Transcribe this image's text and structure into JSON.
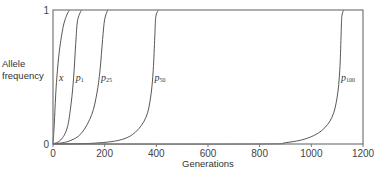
{
  "chart_data": {
    "type": "line",
    "title": "",
    "xlabel": "Generations",
    "ylabel": "Allele frequency",
    "xlim": [
      0,
      1200
    ],
    "ylim": [
      0,
      1
    ],
    "x_ticks": [
      0,
      200,
      400,
      600,
      800,
      1000,
      1200
    ],
    "y_ticks": [
      0,
      1
    ],
    "grid": false,
    "legend": "inline curve labels",
    "series": [
      {
        "name": "x",
        "label_main": "x",
        "label_sub": "",
        "points": [
          [
            0,
            0
          ],
          [
            5,
            0.15
          ],
          [
            10,
            0.35
          ],
          [
            15,
            0.5
          ],
          [
            25,
            0.7
          ],
          [
            40,
            0.88
          ],
          [
            55,
            0.97
          ],
          [
            65,
            1
          ]
        ]
      },
      {
        "name": "p1",
        "label_main": "p",
        "label_sub": "1",
        "points": [
          [
            0,
            0
          ],
          [
            30,
            0.03
          ],
          [
            55,
            0.12
          ],
          [
            70,
            0.3
          ],
          [
            80,
            0.5
          ],
          [
            88,
            0.75
          ],
          [
            95,
            0.92
          ],
          [
            110,
            1
          ]
        ]
      },
      {
        "name": "p25",
        "label_main": "p",
        "label_sub": "25",
        "points": [
          [
            0,
            0
          ],
          [
            60,
            0.02
          ],
          [
            110,
            0.08
          ],
          [
            150,
            0.22
          ],
          [
            170,
            0.38
          ],
          [
            182,
            0.55
          ],
          [
            192,
            0.78
          ],
          [
            200,
            0.93
          ],
          [
            212,
            1
          ]
        ]
      },
      {
        "name": "p50",
        "label_main": "p",
        "label_sub": "50",
        "points": [
          [
            0,
            0
          ],
          [
            150,
            0.005
          ],
          [
            260,
            0.03
          ],
          [
            320,
            0.09
          ],
          [
            360,
            0.2
          ],
          [
            378,
            0.35
          ],
          [
            388,
            0.55
          ],
          [
            394,
            0.8
          ],
          [
            398,
            0.95
          ],
          [
            408,
            1
          ]
        ]
      },
      {
        "name": "p100",
        "label_main": "p",
        "label_sub": "100",
        "points": [
          [
            0,
            0
          ],
          [
            800,
            0.0
          ],
          [
            900,
            0.01
          ],
          [
            980,
            0.04
          ],
          [
            1040,
            0.1
          ],
          [
            1080,
            0.2
          ],
          [
            1100,
            0.35
          ],
          [
            1110,
            0.55
          ],
          [
            1115,
            0.8
          ],
          [
            1118,
            0.95
          ],
          [
            1125,
            1
          ]
        ]
      }
    ]
  },
  "labels": {
    "ylabel_line1": "Allele",
    "ylabel_line2": "frequency",
    "xlabel": "Generations"
  }
}
